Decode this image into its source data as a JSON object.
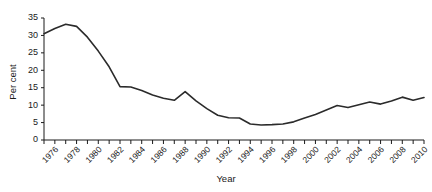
{
  "chart_data": {
    "type": "line",
    "title": "",
    "xlabel": "Year",
    "ylabel": "Per cent",
    "xlim": [
      1975,
      2010
    ],
    "ylim": [
      0,
      35
    ],
    "ytick_values": [
      0,
      5,
      10,
      15,
      20,
      25,
      30,
      35
    ],
    "xtick_labels": [
      "1976",
      "1978",
      "1980",
      "1982",
      "1984",
      "1986",
      "1988",
      "1990",
      "1992",
      "1994",
      "1996",
      "1998",
      "2000",
      "2002",
      "2004",
      "2006",
      "2008",
      "2010"
    ],
    "grid": false,
    "legend": false,
    "line_color": "#2b2b2b",
    "x": [
      1975,
      1976,
      1977,
      1978,
      1979,
      1980,
      1981,
      1982,
      1983,
      1984,
      1985,
      1986,
      1987,
      1988,
      1989,
      1990,
      1991,
      1992,
      1993,
      1994,
      1995,
      1996,
      1997,
      1998,
      1999,
      2000,
      2001,
      2002,
      2003,
      2004,
      2005,
      2006,
      2007,
      2008,
      2009,
      2010
    ],
    "values": [
      30.5,
      32.0,
      33.2,
      32.6,
      29.5,
      25.5,
      21.0,
      15.3,
      15.2,
      14.2,
      12.9,
      12.0,
      11.4,
      13.9,
      11.2,
      9.0,
      7.1,
      6.4,
      6.3,
      4.6,
      4.3,
      4.4,
      4.6,
      5.2,
      6.3,
      7.3,
      8.6,
      9.9,
      9.3,
      10.1,
      10.9,
      10.3,
      11.2,
      12.3,
      11.4,
      12.2
    ],
    "series": [
      {
        "name": "Per cent",
        "values": [
          30.5,
          32.0,
          33.2,
          32.6,
          29.5,
          25.5,
          21.0,
          15.3,
          15.2,
          14.2,
          12.9,
          12.0,
          11.4,
          13.9,
          11.2,
          9.0,
          7.1,
          6.4,
          6.3,
          4.6,
          4.3,
          4.4,
          4.6,
          5.2,
          6.3,
          7.3,
          8.6,
          9.9,
          9.3,
          10.1,
          10.9,
          10.3,
          11.2,
          12.3,
          11.4,
          12.2
        ]
      }
    ]
  }
}
